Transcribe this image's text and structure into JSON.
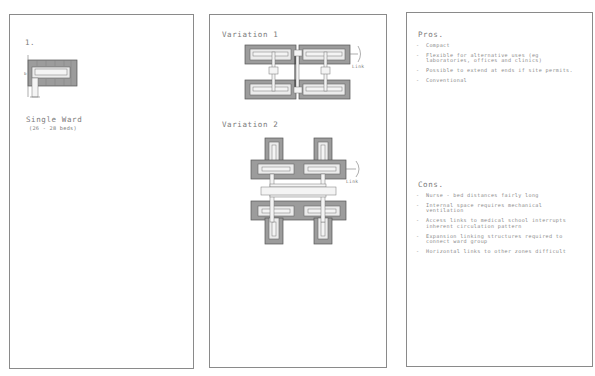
{
  "panels": {
    "left": {
      "number": "1.",
      "title": "Single Ward",
      "subtitle": "(26 - 28 beds)"
    },
    "middle": {
      "variation1": {
        "title": "Variation 1",
        "link_label": "Link"
      },
      "variation2": {
        "title": "Variation 2",
        "link_label": "Link"
      }
    },
    "right": {
      "pros": {
        "title": "Pros.",
        "items": [
          "Compact",
          "Flexible for alternative uses (eg laboratories, offices and clinics)",
          "Possible to extend at ends if site permits.",
          "Conventional"
        ]
      },
      "cons": {
        "title": "Cons.",
        "items": [
          "Nurse - bed distances fairly long",
          "Internal space requires mechanical ventilation",
          "Access links to medical school interrupts inherent circulation pattern",
          "Expansion linking structures required to connect ward group",
          "Horizontal links to other zones difficult"
        ]
      }
    }
  },
  "colors": {
    "block_fill": "#9c9c9c",
    "inner_fill": "#ececec",
    "stroke": "#555555",
    "panel_border": "#8a8a8a",
    "text": "#7a7a7a"
  }
}
